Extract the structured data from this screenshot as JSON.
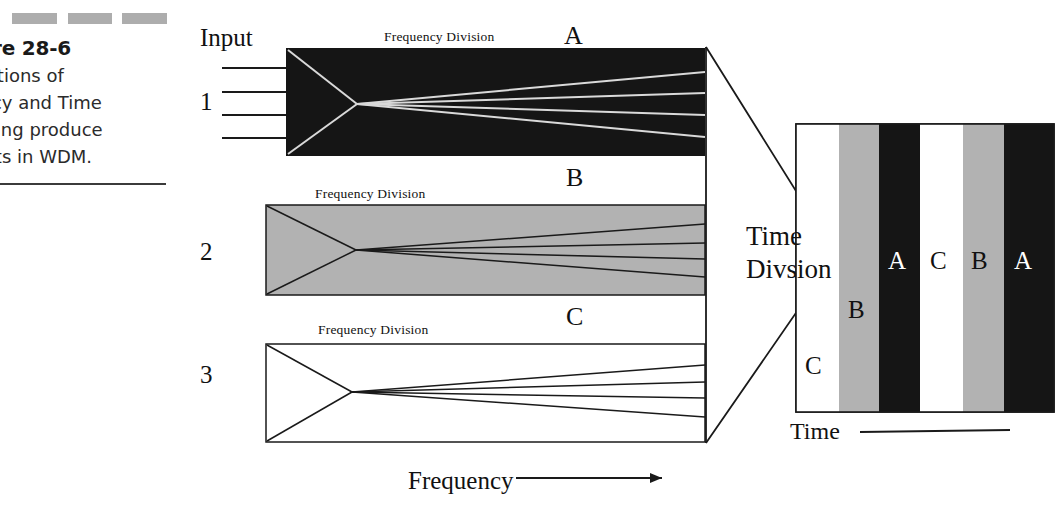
{
  "caption": {
    "swatch_count": 3,
    "swatch_color": "#adadad",
    "figure_number": "ure 28-6",
    "body": "binations of\nuency and Time\nplexing produce\nesults in WDM."
  },
  "diagram": {
    "input_label": "Input",
    "groups": [
      {
        "number": "1",
        "input_line_count": 4,
        "band_label": "A",
        "fd_label": "Frequency Division",
        "fill": "#151515",
        "line_color": "#d8d8d8",
        "style": "black"
      },
      {
        "number": "2",
        "input_line_count": 0,
        "band_label": "B",
        "fd_label": "Frequency Division",
        "fill": "#b2b2b2",
        "line_color": "#1a1a1a",
        "style": "gray"
      },
      {
        "number": "3",
        "input_line_count": 0,
        "band_label": "C",
        "fd_label": "Frequency Division",
        "fill": "#ffffff",
        "line_color": "#1a1a1a",
        "style": "white"
      }
    ],
    "combiner": {
      "label": "Time\nDivsion"
    },
    "frequency_axis": {
      "label": "Frequency",
      "arrow": true
    },
    "time_axis": {
      "label": "Time",
      "arrow": false
    },
    "output": {
      "bars": [
        {
          "label": "C",
          "fill": "#ffffff",
          "text_color": "#111111",
          "label_y": 352
        },
        {
          "label": "B",
          "fill": "#b2b2b2",
          "text_color": "#111111",
          "label_y": 296
        },
        {
          "label": "A",
          "fill": "#151515",
          "text_color": "#ffffff",
          "label_y": 247
        },
        {
          "label": "C",
          "fill": "#ffffff",
          "text_color": "#111111",
          "label_y": 247
        },
        {
          "label": "B",
          "fill": "#b2b2b2",
          "text_color": "#111111",
          "label_y": 247
        },
        {
          "label": "A",
          "fill": "#151515",
          "text_color": "#ffffff",
          "label_y": 247
        }
      ]
    }
  }
}
